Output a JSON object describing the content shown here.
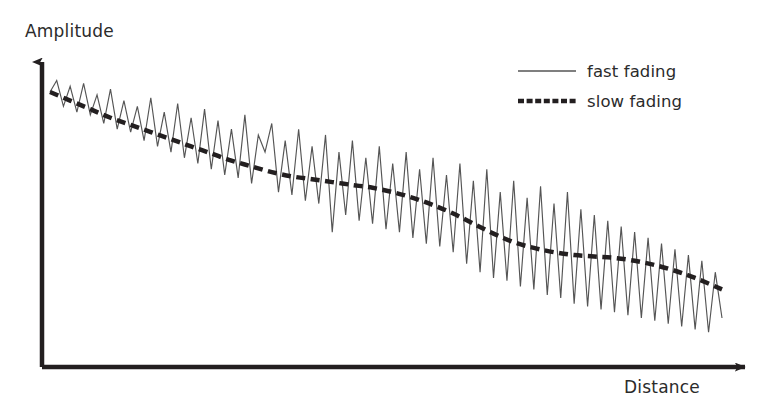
{
  "figure": {
    "background_color": "#ffffff",
    "ink_color": "#231f20",
    "axes": {
      "y_axis": {
        "label": "Amplitude",
        "name": "amplitude-axis",
        "origin": [
          42,
          367
        ],
        "tip": [
          42,
          50
        ],
        "arrow": true
      },
      "x_axis": {
        "label": "Distance",
        "name": "distance-axis",
        "origin": [
          42,
          367
        ],
        "tip": [
          757,
          367
        ],
        "arrow": true
      }
    },
    "legend": {
      "position": "top-right",
      "entries": [
        {
          "label": "fast fading",
          "style": "solid",
          "width": 1,
          "color": "#555555"
        },
        {
          "label": "slow fading",
          "style": "dashed",
          "width": 4.5,
          "color": "#231f20"
        }
      ]
    }
  },
  "chart_data": {
    "type": "line",
    "title": "",
    "subtitle": "",
    "xlabel": "Distance",
    "ylabel": "Amplitude",
    "xlim": [
      0,
      100
    ],
    "ylim": [
      0,
      100
    ],
    "grid": false,
    "legend_position": "top-right",
    "axis_ticks": {
      "x": [],
      "y": []
    },
    "annotations": [],
    "series": [
      {
        "name": "slow fading",
        "style": "dashed",
        "description": "Smooth monotonically decreasing mean path-loss trend (local mean), drawn as a thick dashed curve with a step-like shoulder near mid-distance.",
        "x": [
          0,
          3,
          6,
          9,
          12,
          15,
          18,
          21,
          24,
          27,
          30,
          33,
          36,
          39,
          42,
          45,
          48,
          51,
          54,
          57,
          60,
          63,
          66,
          69,
          72,
          75,
          78,
          81,
          84,
          87,
          90,
          93,
          96,
          100
        ],
        "y": [
          93,
          90,
          87,
          84,
          81.5,
          79,
          76.5,
          74,
          71.5,
          69,
          67,
          65,
          63.5,
          62.5,
          61.5,
          60.5,
          59.5,
          58,
          56,
          53.5,
          50.5,
          47,
          43.5,
          40.5,
          38.5,
          37,
          36,
          35.5,
          35,
          34,
          32.5,
          30.5,
          28,
          24
        ]
      },
      {
        "name": "fast fading",
        "style": "solid",
        "description": "Rapidly varying multipath (Rayleigh-like) envelope oscillating about the slow-fading mean; peak-to-trough swings grow slightly with distance.",
        "x": [
          0,
          1,
          2,
          3,
          4,
          5,
          6,
          7,
          8,
          9,
          10,
          11,
          12,
          13,
          14,
          15,
          16,
          17,
          18,
          19,
          20,
          21,
          22,
          23,
          24,
          25,
          26,
          27,
          28,
          29,
          30,
          31,
          32,
          33,
          34,
          35,
          36,
          37,
          38,
          39,
          40,
          41,
          42,
          43,
          44,
          45,
          46,
          47,
          48,
          49,
          50,
          51,
          52,
          53,
          54,
          55,
          56,
          57,
          58,
          59,
          60,
          61,
          62,
          63,
          64,
          65,
          66,
          67,
          68,
          69,
          70,
          71,
          72,
          73,
          74,
          75,
          76,
          77,
          78,
          79,
          80,
          81,
          82,
          83,
          84,
          85,
          86,
          87,
          88,
          89,
          90,
          91,
          92,
          93,
          94,
          95,
          96,
          97,
          98,
          99,
          100
        ],
        "y": [
          93,
          97,
          88,
          95,
          86,
          96,
          85,
          92,
          82,
          94,
          80,
          90,
          79,
          88,
          76,
          91,
          74,
          86,
          72,
          89,
          70,
          84,
          68,
          87,
          66,
          83,
          64,
          80,
          63,
          85,
          61,
          78,
          72,
          82,
          58,
          76,
          57,
          80,
          55,
          74,
          54,
          78,
          44,
          72,
          50,
          76,
          48,
          70,
          47,
          74,
          45,
          68,
          44,
          72,
          42,
          66,
          40,
          70,
          39,
          64,
          37,
          68,
          33,
          62,
          30,
          66,
          28,
          58,
          27,
          62,
          25,
          56,
          24,
          60,
          22,
          54,
          21,
          58,
          19,
          52,
          18,
          50,
          17,
          48,
          16,
          46,
          15,
          44,
          14,
          42,
          13,
          40,
          12,
          38,
          11,
          36,
          10,
          34,
          9,
          30,
          14
        ]
      }
    ]
  }
}
